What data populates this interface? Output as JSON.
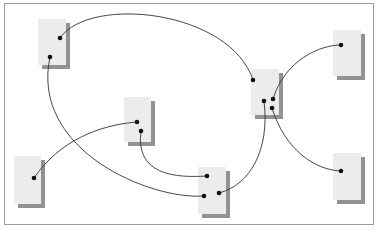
{
  "diagram": {
    "title": "",
    "colors": {
      "node_fill": "#ececec",
      "node_shadow": "#6e6e6e",
      "edge": "#333333",
      "port": "#111111",
      "frame": "#9a9a9a"
    },
    "nodes": [
      {
        "id": "node-a",
        "label": "",
        "ports": 2
      },
      {
        "id": "node-b",
        "label": "",
        "ports": 2
      },
      {
        "id": "node-c",
        "label": "",
        "ports": 1
      },
      {
        "id": "node-d",
        "label": "",
        "ports": 3
      },
      {
        "id": "node-e",
        "label": "",
        "ports": 4
      },
      {
        "id": "node-f",
        "label": "",
        "ports": 1
      },
      {
        "id": "node-g",
        "label": "",
        "ports": 1
      }
    ],
    "edges": [
      {
        "from": "node-a",
        "to": "node-e"
      },
      {
        "from": "node-a",
        "to": "node-d"
      },
      {
        "from": "node-c",
        "to": "node-b"
      },
      {
        "from": "node-b",
        "to": "node-d"
      },
      {
        "from": "node-e",
        "to": "node-f"
      },
      {
        "from": "node-e",
        "to": "node-g"
      },
      {
        "from": "node-e",
        "to": "node-d"
      }
    ]
  }
}
